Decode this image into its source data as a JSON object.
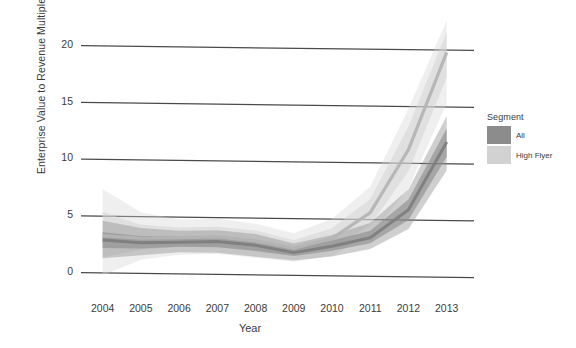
{
  "chart_data": {
    "type": "area",
    "title": "",
    "subtitle": "",
    "xlabel": "Year",
    "ylabel": "Enterprise Value to Revenue Multiple",
    "x": [
      2004,
      2005,
      2006,
      2007,
      2008,
      2009,
      2010,
      2011,
      2012,
      2013
    ],
    "xticklabels": [
      "2004",
      "2005",
      "2006",
      "2007",
      "2008",
      "2009",
      "2010",
      "2011",
      "2012",
      "2013"
    ],
    "yticklabels": [
      "0",
      "5",
      "10",
      "15",
      "20"
    ],
    "yticks": [
      0,
      5,
      10,
      15,
      20
    ],
    "ylim": [
      -0.8,
      22.8
    ],
    "xlim": [
      2003.8,
      2013.4
    ],
    "grid": "horizontal-only",
    "legend": {
      "title": "Segment",
      "position": "right",
      "entries": [
        {
          "name": "All",
          "color": "#8c8c8c"
        },
        {
          "name": "High Flyer",
          "color": "#d2d2d2"
        }
      ]
    },
    "series": [
      {
        "name": "All",
        "color": "#8c8c8c",
        "values": [
          2.9,
          2.7,
          2.8,
          2.9,
          2.6,
          2.0,
          2.6,
          3.4,
          5.9,
          11.9
        ],
        "band_inner_low": [
          2.2,
          2.2,
          2.4,
          2.4,
          2.1,
          1.7,
          2.2,
          2.9,
          5.0,
          10.6
        ],
        "band_inner_high": [
          3.6,
          3.3,
          3.3,
          3.4,
          3.1,
          2.4,
          3.1,
          4.0,
          6.8,
          13.1
        ],
        "band_outer_low": [
          1.3,
          1.6,
          1.9,
          1.9,
          1.6,
          1.3,
          1.7,
          2.4,
          4.2,
          9.4
        ],
        "band_outer_high": [
          4.6,
          4.0,
          3.8,
          3.9,
          3.6,
          2.8,
          3.6,
          4.7,
          7.7,
          14.2
        ]
      },
      {
        "name": "High Flyer",
        "color": "#d2d2d2",
        "values": [
          3.3,
          3.1,
          3.2,
          3.3,
          3.0,
          2.4,
          3.3,
          5.6,
          11.2,
          19.8
        ],
        "band_inner_low": [
          1.4,
          2.1,
          2.4,
          2.5,
          2.2,
          1.8,
          2.5,
          4.5,
          9.3,
          17.6
        ],
        "band_inner_high": [
          5.4,
          4.3,
          4.1,
          4.2,
          3.9,
          3.1,
          4.2,
          6.8,
          13.2,
          21.6
        ],
        "band_outer_low": [
          -0.2,
          1.2,
          1.7,
          1.8,
          1.5,
          1.2,
          1.8,
          3.6,
          7.8,
          15.3
        ],
        "band_outer_high": [
          7.4,
          5.4,
          4.8,
          4.9,
          4.5,
          3.7,
          5.0,
          7.9,
          14.8,
          22.6
        ]
      }
    ]
  }
}
